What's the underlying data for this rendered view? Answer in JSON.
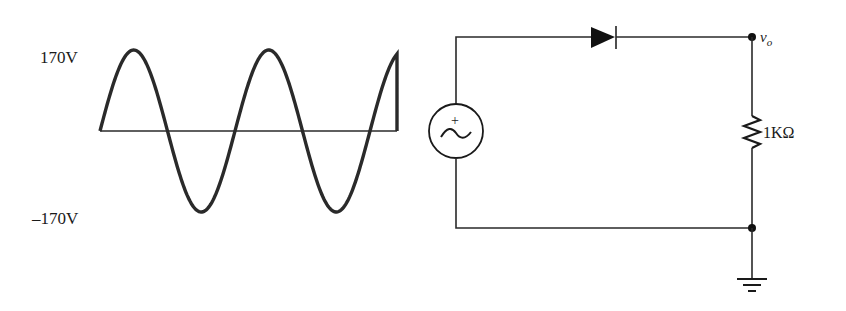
{
  "waveform": {
    "label_positive_peak": "170V",
    "label_negative_peak": "–170V",
    "peak_volts": 170,
    "cycles_shown": 2.2,
    "signal": "sine"
  },
  "circuit": {
    "source": {
      "type": "ac-voltage-source",
      "polarity_mark": "+",
      "symbol": "~"
    },
    "diode": {
      "type": "diode",
      "orientation": "anode-left"
    },
    "resistor": {
      "label": "1KΩ",
      "value": "1KΩ"
    },
    "output_node": {
      "label_main": "v",
      "label_sub": "o"
    },
    "ground": {
      "type": "ground"
    }
  },
  "colors": {
    "ink": "#2a2a2a",
    "background": "#ffffff"
  }
}
